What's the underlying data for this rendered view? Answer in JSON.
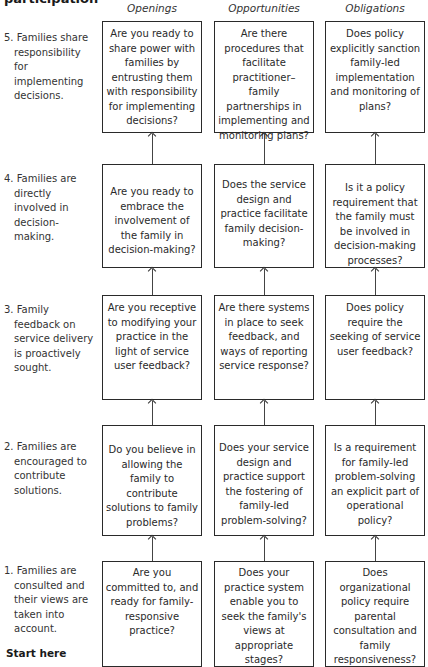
{
  "title": "participation",
  "columns": [
    {
      "label": "Openings"
    },
    {
      "label": "Opportunities"
    },
    {
      "label": "Obligations"
    }
  ],
  "levels": [
    {
      "number": "5.",
      "text": "Families share responsibility for implementing decisions.",
      "cells": [
        "Are you ready to share power with families by entrusting them with responsibility for implementing decisions?",
        "Are there procedures that facilitate practitioner–family partnerships in implementing and monitoring plans?",
        "Does policy explicitly sanction family-led implementation and monitoring of plans?"
      ]
    },
    {
      "number": "4.",
      "text": "Families are directly involved in decision-making.",
      "cells": [
        "Are you ready to embrace the involvement of the family in decision-making?",
        "Does the service design and practice facilitate family decision-making?",
        "Is it a policy requirement that the family must be involved in decision-making processes?"
      ]
    },
    {
      "number": "3.",
      "text": "Family feedback on service delivery is proactively sought.",
      "cells": [
        "Are you receptive to modifying your practice in the light of service user feedback?",
        "Are there systems in place to seek feedback, and ways of reporting service response?",
        "Does policy require the seeking of service user feedback?"
      ]
    },
    {
      "number": "2.",
      "text": "Families are encouraged to contribute solutions.",
      "cells": [
        "Do you believe in allowing the family to contribute solutions to family problems?",
        "Does your service design and practice support the fostering of family-led problem-solving?",
        "Is a requirement for family-led problem-solving an explicit part of operational policy?"
      ]
    },
    {
      "number": "1.",
      "text": "Families are consulted and their views are taken into account.",
      "cells": [
        "Are you committed to, and ready for family-responsive practice?",
        "Does your practice system enable you to seek the family's views at appropriate stages?",
        "Does organizational policy require parental consultation and family responsiveness?"
      ]
    }
  ],
  "footer": {
    "start_label": "Start here"
  }
}
